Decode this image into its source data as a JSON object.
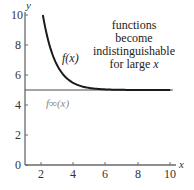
{
  "chart_data": {
    "type": "line",
    "title": "",
    "xlabel": "x",
    "ylabel": "y",
    "xlim": [
      1,
      10.3
    ],
    "ylim": [
      0,
      10
    ],
    "grid": false,
    "x_ticks": [
      2,
      4,
      6,
      8,
      10
    ],
    "y_ticks": [
      0,
      2,
      4,
      6,
      8,
      10
    ],
    "series": [
      {
        "name": "f(x)",
        "label": "f(x)",
        "color": "#1a1a1a",
        "x": [
          2.1,
          2.5,
          3.0,
          3.5,
          4.0,
          5.0,
          6.0,
          7.0,
          8.0,
          9.0,
          10.0
        ],
        "values": [
          10.0,
          8.03,
          6.62,
          5.87,
          5.47,
          5.13,
          5.04,
          5.01,
          5.0,
          5.0,
          5.0
        ]
      },
      {
        "name": "f_inf(x)",
        "label": "f∞(x)",
        "color": "#555555",
        "x": [
          1,
          10.3
        ],
        "values": [
          5,
          5
        ]
      }
    ],
    "annotations": [
      {
        "text": [
          "functions",
          "become",
          "indistinguishable",
          "for large x"
        ],
        "x": 7.0,
        "y": 8.6
      }
    ]
  },
  "labels": {
    "y_axis": "y",
    "x_axis": "x",
    "f_label": "f(x)",
    "finf_label": "f∞(x)",
    "annot_line1": "functions",
    "annot_line2": "become",
    "annot_line3": "indistinguishable",
    "annot_line4_a": "for large ",
    "annot_line4_b": "x",
    "ticks_x": [
      "2",
      "4",
      "6",
      "8",
      "10"
    ],
    "ticks_y": [
      "0",
      "2",
      "4",
      "6",
      "8",
      "10"
    ]
  }
}
